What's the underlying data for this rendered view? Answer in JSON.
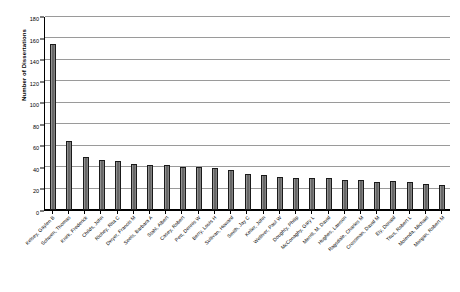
{
  "chart_data": {
    "type": "bar",
    "title": "",
    "xlabel": "",
    "ylabel": "Number of Dissertations",
    "ylim": [
      0,
      180
    ],
    "ytick_step": 20,
    "yticks": [
      0,
      20,
      40,
      60,
      80,
      100,
      120,
      140,
      160,
      180
    ],
    "grid": true,
    "legend": "none",
    "bar_color": "#737373",
    "bar_edge_color": "#1a1a1a",
    "gridline_color": "#9a9a9a",
    "axis_color": "#000000",
    "categories": [
      "Kelsey, Gaylen B",
      "Schwen, Thomas",
      "Knirk, Frederick",
      "Childs, John",
      "Richey, Rita C",
      "Dwyer, Francis M",
      "Seels, Barbara A",
      "Stahl, Albert",
      "Casey, Robert",
      "Pett, Dennis W",
      "Berry, Louis H",
      "Sullivan, Howard",
      "Smith, Jay C",
      "Keller, John",
      "Welliver, Paul W",
      "Doughty, Philip",
      "McConaghy, Gary L",
      "Merrill, M. David",
      "Hughes, Lawson",
      "Ragsdale, Charles M",
      "Crossman, David M",
      "Ely, Donald",
      "Titus, Robert L",
      "Molenda, Michael",
      "Morgan, Robert M"
    ],
    "values": [
      155,
      64,
      49,
      47,
      46,
      43,
      42,
      42,
      40,
      40,
      39,
      37,
      34,
      33,
      31,
      30,
      30,
      30,
      28,
      28,
      26,
      27,
      26,
      24,
      23
    ]
  }
}
